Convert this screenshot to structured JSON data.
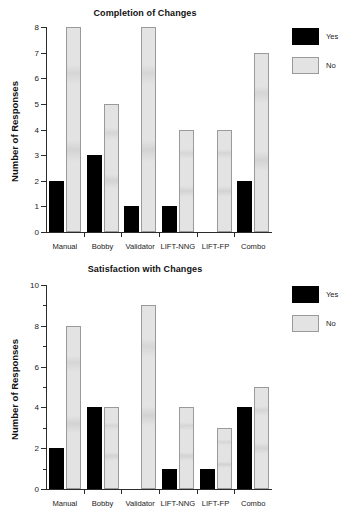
{
  "figure": {
    "width": 357,
    "height": 520,
    "background": "#ffffff",
    "series_colors": {
      "yes": "#000000",
      "no": "#e3e3e3"
    }
  },
  "charts": [
    {
      "id": "completion-of-changes",
      "title": "Completion of Changes",
      "ylabel": "Number of Responses",
      "legend": [
        {
          "key": "yes",
          "label": "Yes",
          "color": "#000000"
        },
        {
          "key": "no",
          "label": "No",
          "color": "#e3e3e3"
        }
      ],
      "yticks": [
        0,
        1,
        2,
        3,
        4,
        5,
        6,
        7,
        8
      ],
      "categories": [
        "Manual",
        "Bobby",
        "Validator",
        "LIFT-NNG",
        "LIFT-FP",
        "Combo"
      ],
      "yes": [
        2,
        3,
        1,
        1,
        0,
        2
      ],
      "no": [
        8,
        5,
        8,
        4,
        4,
        7
      ]
    },
    {
      "id": "satisfaction-with-changes",
      "title": "Satisfaction with Changes",
      "ylabel": "Number of Responses",
      "legend": [
        {
          "key": "yes",
          "label": "Yes",
          "color": "#000000"
        },
        {
          "key": "no",
          "label": "No",
          "color": "#e3e3e3"
        }
      ],
      "yticks": [
        0,
        2,
        4,
        6,
        8,
        10
      ],
      "categories": [
        "Manual",
        "Bobby",
        "Validator",
        "LIFT-NNG",
        "LIFT-FP",
        "Combo"
      ],
      "yes": [
        2,
        4,
        0,
        1,
        1,
        4
      ],
      "no": [
        8,
        4,
        9,
        4,
        3,
        5
      ]
    }
  ],
  "chart_data": [
    {
      "type": "bar",
      "title": "Completion of Changes",
      "xlabel": "",
      "ylabel": "Number of Responses",
      "categories": [
        "Manual",
        "Bobby",
        "Validator",
        "LIFT-NNG",
        "LIFT-FP",
        "Combo"
      ],
      "series": [
        {
          "name": "Yes",
          "values": [
            2,
            3,
            1,
            1,
            0,
            2
          ],
          "color": "#000000"
        },
        {
          "name": "No",
          "values": [
            8,
            5,
            8,
            4,
            4,
            7
          ],
          "color": "#e3e3e3"
        }
      ],
      "ylim": [
        0,
        8
      ],
      "ytick_step": 1,
      "ytick_labels": [
        "0",
        "1",
        "2",
        "3",
        "4",
        "5",
        "6",
        "7",
        "8"
      ],
      "grid": false,
      "legend_position": "right"
    },
    {
      "type": "bar",
      "title": "Satisfaction with Changes",
      "xlabel": "",
      "ylabel": "Number of Responses",
      "categories": [
        "Manual",
        "Bobby",
        "Validator",
        "LIFT-NNG",
        "LIFT-FP",
        "Combo"
      ],
      "series": [
        {
          "name": "Yes",
          "values": [
            2,
            4,
            0,
            1,
            1,
            4
          ],
          "color": "#000000"
        },
        {
          "name": "No",
          "values": [
            8,
            4,
            9,
            4,
            3,
            5
          ],
          "color": "#e3e3e3"
        }
      ],
      "ylim": [
        0,
        10
      ],
      "ytick_step": 2,
      "ytick_labels": [
        "0",
        "2",
        "4",
        "6",
        "8",
        "10"
      ],
      "grid": false,
      "legend_position": "right"
    }
  ]
}
